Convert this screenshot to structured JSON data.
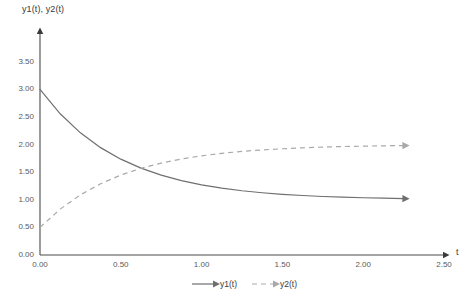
{
  "chart_data": {
    "type": "line",
    "title": "",
    "xlabel": "t",
    "ylabel": "y1(t), y2(t)",
    "xlim": [
      0.0,
      2.5
    ],
    "ylim": [
      0.0,
      3.5
    ],
    "xticks": [
      "0.00",
      "0.50",
      "1.00",
      "1.50",
      "2.00",
      "2.50"
    ],
    "xtick_values": [
      0.0,
      0.5,
      1.0,
      1.5,
      2.0,
      2.5
    ],
    "yticks": [
      "0.00",
      "0.50",
      "1.00",
      "1.50",
      "2.00",
      "2.50",
      "3.00",
      "3.50"
    ],
    "ytick_values": [
      0.0,
      0.5,
      1.0,
      1.5,
      2.0,
      2.5,
      3.0,
      3.5
    ],
    "grid": false,
    "legend_position": "bottom-center",
    "x": [
      0.0,
      0.125,
      0.25,
      0.375,
      0.5,
      0.625,
      0.75,
      0.875,
      1.0,
      1.125,
      1.25,
      1.375,
      1.5,
      1.625,
      1.75,
      1.875,
      2.0,
      2.125,
      2.25
    ],
    "series": [
      {
        "name": "y1(t)",
        "style": "solid",
        "color": "#6f6f6f",
        "arrow": true,
        "start_value": 3.0,
        "end_value": 1.02,
        "asymptote": 1.0,
        "values": [
          3.0,
          2.558,
          2.213,
          1.945,
          1.736,
          1.573,
          1.446,
          1.347,
          1.271,
          1.211,
          1.164,
          1.128,
          1.1,
          1.078,
          1.06,
          1.047,
          1.037,
          1.029,
          1.022
        ]
      },
      {
        "name": "y2(t)",
        "style": "dashed",
        "color": "#a9a9a9",
        "arrow": true,
        "start_value": 0.5,
        "end_value": 1.983,
        "asymptote": 2.0,
        "values": [
          0.5,
          0.831,
          1.09,
          1.291,
          1.448,
          1.57,
          1.665,
          1.74,
          1.797,
          1.842,
          1.877,
          1.904,
          1.925,
          1.941,
          1.955,
          1.965,
          1.972,
          1.978,
          1.983
        ]
      }
    ],
    "legend": [
      {
        "name": "y1(t)",
        "style": "solid",
        "color": "#6f6f6f"
      },
      {
        "name": "y2(t)",
        "style": "dashed",
        "color": "#a9a9a9"
      }
    ]
  },
  "axes": {
    "y_axis_title": "y1(t), y2(t)",
    "x_axis_title": "t"
  },
  "colors": {
    "series1": "#6f6f6f",
    "series2": "#a9a9a9",
    "axis": "#4a4a4a",
    "tick_text": "#5a5a5a",
    "background": "#ffffff"
  }
}
